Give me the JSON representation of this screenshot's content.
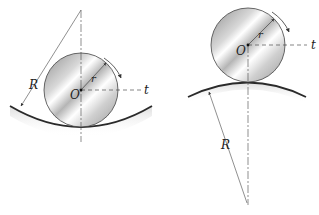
{
  "diagram": {
    "left": {
      "title": "wheel rolling inside concave surface",
      "center_label": "O",
      "radius_label": "r",
      "tangent_label": "t",
      "surface_radius_label": "R"
    },
    "right": {
      "title": "wheel rolling on convex surface",
      "center_label": "O",
      "radius_label": "r",
      "tangent_label": "t",
      "surface_radius_label": "R"
    },
    "colors": {
      "line": "#333333",
      "wheel_light": "#f2f2f2",
      "wheel_dark": "#9a9a9a",
      "surface": "#2a2a2a"
    }
  }
}
